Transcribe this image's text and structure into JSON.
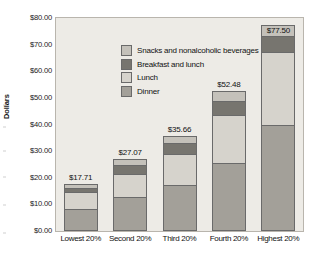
{
  "chart_data": {
    "type": "bar",
    "subtype": "stacked-bar",
    "title": "",
    "xlabel": "",
    "ylabel": "Dollars",
    "ylim": [
      0,
      80
    ],
    "ytick_step": 10,
    "grid": false,
    "legend_position": "inside-top-left",
    "categories": [
      "Lowest 20%",
      "Second 20%",
      "Third 20%",
      "Fourth 20%",
      "Highest 20%"
    ],
    "ytick_labels": [
      "$0.00",
      "$10.00",
      "$20.00",
      "$30.00",
      "$40.00",
      "$50.00",
      "$60.00",
      "$70.00",
      "$80.00"
    ],
    "series": [
      {
        "name": "Dinner",
        "color": "#a3a099",
        "values": [
          8.1,
          12.6,
          17.4,
          25.7,
          39.9
        ]
      },
      {
        "name": "Lunch",
        "color": "#d6d3cc",
        "values": [
          6.4,
          9.0,
          11.4,
          18.0,
          27.4
        ]
      },
      {
        "name": "Breakfast and lunch",
        "color": "#77756f",
        "values": [
          1.8,
          3.1,
          4.2,
          5.3,
          6.1
        ]
      },
      {
        "name": "Snacks and nonalcoholic beverages",
        "color": "#c4c1ba",
        "values": [
          1.41,
          2.37,
          2.66,
          3.48,
          4.1
        ]
      }
    ],
    "totals": [
      "$17.71",
      "$27.07",
      "$35.66",
      "$52.48",
      "$77.50"
    ],
    "total_values": [
      17.71,
      27.07,
      35.66,
      52.48,
      77.5
    ],
    "label_inside_top_segment": [
      false,
      false,
      false,
      false,
      true
    ],
    "legend_order": [
      "Snacks and nonalcoholic beverages",
      "Breakfast and lunch",
      "Lunch",
      "Dinner"
    ]
  },
  "style": {
    "plot_background": "#edebe6",
    "plot_border": "#b9b5ad",
    "segment_outline": "#6a6a6a",
    "text_color": "#111111",
    "page_background": "#ffffff"
  }
}
